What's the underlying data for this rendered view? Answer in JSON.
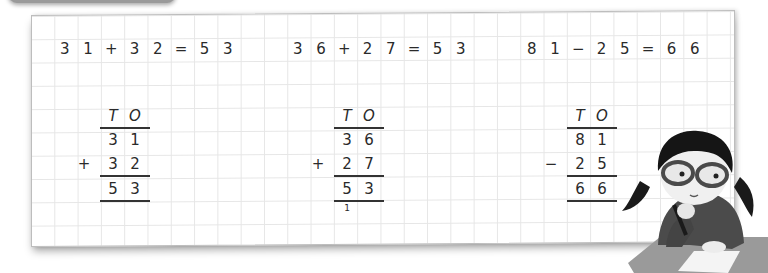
{
  "equations": [
    {
      "tokens": [
        "3",
        "1",
        "+",
        "3",
        "2",
        "=",
        "5",
        "3"
      ]
    },
    {
      "tokens": [
        "3",
        "6",
        "+",
        "2",
        "7",
        "=",
        "5",
        "3"
      ]
    },
    {
      "tokens": [
        "8",
        "1",
        "−",
        "2",
        "5",
        "=",
        "6",
        "6"
      ]
    }
  ],
  "columns": [
    {
      "header": [
        "T",
        "O"
      ],
      "top": [
        "3",
        "1"
      ],
      "operator": "+",
      "bottom": [
        "3",
        "2"
      ],
      "result": [
        "5",
        "3"
      ],
      "carry": ""
    },
    {
      "header": [
        "T",
        "O"
      ],
      "top": [
        "3",
        "6"
      ],
      "operator": "+",
      "bottom": [
        "2",
        "7"
      ],
      "result": [
        "5",
        "3"
      ],
      "carry": "1"
    },
    {
      "header": [
        "T",
        "O"
      ],
      "top": [
        "8",
        "1"
      ],
      "operator": "−",
      "bottom": [
        "2",
        "5"
      ],
      "result": [
        "6",
        "6"
      ],
      "carry": ""
    }
  ],
  "illustration": {
    "subject": "girl-with-glasses-thinking-at-desk"
  },
  "colors": {
    "grid_line": "#e6e6e6",
    "ink": "#2a2a2a",
    "paper_border": "#bdbdbd"
  }
}
